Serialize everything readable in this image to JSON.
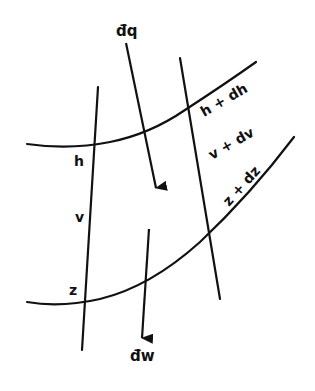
{
  "diagram": {
    "colors": {
      "stroke": "#111111",
      "background": "#ffffff"
    },
    "labels": {
      "dq": "đq",
      "dw": "đw",
      "h": "h",
      "v": "v",
      "z": "z",
      "h_plus_dh": "h + dh",
      "v_plus_dv": "v + dv",
      "z_plus_dz": "z + dz"
    },
    "curves": [
      {
        "name": "surface-h",
        "label": "h"
      },
      {
        "name": "surface-z",
        "label": "z"
      }
    ],
    "boundaries": [
      {
        "name": "boundary-left"
      },
      {
        "name": "boundary-right"
      }
    ],
    "arrows": [
      {
        "name": "heat-input",
        "label": "đq",
        "direction": "down"
      },
      {
        "name": "work-output",
        "label": "đw",
        "direction": "down"
      }
    ]
  }
}
